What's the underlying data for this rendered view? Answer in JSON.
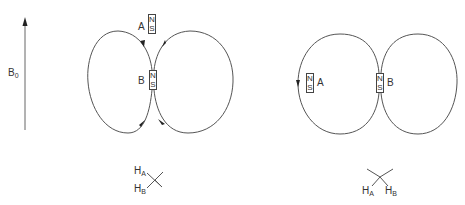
{
  "field": {
    "label": "B",
    "subscript": "0"
  },
  "left_panel": {
    "magnet_a": {
      "label": "A",
      "north": "N",
      "south": "S"
    },
    "magnet_b": {
      "label": "B",
      "north": "N",
      "south": "S"
    },
    "molecule": {
      "h_a": "H",
      "h_a_sub": "A",
      "h_b": "H",
      "h_b_sub": "B"
    }
  },
  "right_panel": {
    "magnet_a": {
      "label": "A",
      "north": "N",
      "south": "S"
    },
    "magnet_b": {
      "label": "B",
      "north": "N",
      "south": "S"
    },
    "molecule": {
      "h_a": "H",
      "h_a_sub": "A",
      "h_b": "H",
      "h_b_sub": "B"
    }
  },
  "colors": {
    "line": "#555555",
    "text": "#333333"
  }
}
